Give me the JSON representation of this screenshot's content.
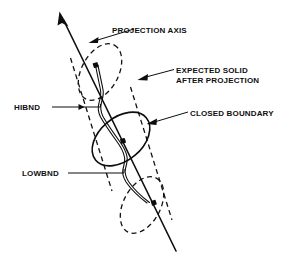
{
  "figure": {
    "background_color": "#ffffff",
    "ink_color": "#0d0d0d",
    "labels": {
      "projection_axis": "PROJECTION AXIS",
      "expected_solid_line1": "EXPECTED SOLID",
      "expected_solid_line2": "AFTER PROJECTION",
      "closed_boundary": "CLOSED BOUNDARY",
      "hibnd": "HIBND",
      "lowbnd": "LOWBND"
    },
    "geometry": {
      "axis": {
        "start_x": 60,
        "start_y": 14,
        "end_x": 176,
        "end_y": 252,
        "arrow_at": "start",
        "description": "long straight line with arrowhead at upper-left end"
      },
      "cylinder": {
        "style": "dashed",
        "description": "expected solid after projection, drawn as a dashed oblique cylinder around the axis",
        "top_cap": {
          "cx": 100,
          "cy": 72,
          "rx": 30,
          "ry": 18,
          "rotation": -62
        },
        "bottom_cap": {
          "cx": 142,
          "cy": 205,
          "rx": 30,
          "ry": 18,
          "rotation": -62
        },
        "left_wall": {
          "x1": 69,
          "y1": 56,
          "x2": 112,
          "y2": 190
        },
        "right_wall": {
          "x1": 131,
          "y1": 88,
          "x2": 173,
          "y2": 222
        }
      },
      "closed_boundary": {
        "style": "solid",
        "cx": 121,
        "cy": 139,
        "rx": 33,
        "ry": 21,
        "rotation": -42
      },
      "wavy_curve": {
        "style": "solid",
        "description": "boundary trace weaving along the projection axis between the end caps"
      },
      "markers": [
        {
          "name": "hibnd-point",
          "x": 96,
          "y": 66
        },
        {
          "name": "mid-point",
          "x": 123,
          "y": 141
        },
        {
          "name": "lowbnd-point",
          "x": 154,
          "y": 203
        }
      ]
    },
    "leaders": [
      {
        "name": "projection-axis-leader",
        "from_x": 107,
        "from_y": 30,
        "to_x": 93,
        "to_y": 40,
        "arrow": true
      },
      {
        "name": "expected-solid-leader",
        "from_x": 172,
        "from_y": 70,
        "to_x": 139,
        "to_y": 80,
        "arrow": true
      },
      {
        "name": "closed-boundary-leader",
        "from_x": 160,
        "from_y": 115,
        "to_x": 147,
        "to_y": 122,
        "arrow": true
      },
      {
        "name": "hibnd-leader",
        "from_x": 52,
        "from_y": 107,
        "to_x": 110,
        "to_y": 107,
        "arrow": false
      },
      {
        "name": "lowbnd-leader",
        "from_x": 68,
        "from_y": 173,
        "to_x": 128,
        "to_y": 173,
        "arrow": false
      }
    ]
  }
}
